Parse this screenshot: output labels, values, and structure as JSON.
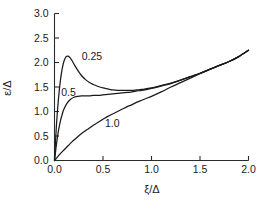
{
  "chart_data": {
    "type": "line",
    "title": "",
    "subtitle": "",
    "xlabel": "ξ/Δ",
    "ylabel": "ε/Δ",
    "xlim": [
      0.0,
      2.0
    ],
    "ylim": [
      0.0,
      3.0
    ],
    "xticks": [
      0.0,
      0.5,
      1.0,
      1.5,
      2.0
    ],
    "yticks": [
      0.0,
      0.5,
      1.0,
      1.5,
      2.0,
      2.5,
      3.0
    ],
    "xtick_labels": [
      "0.0",
      "0.5",
      "1.0",
      "1.5",
      "2.0"
    ],
    "ytick_labels": [
      "0.0",
      "0.5",
      "1.0",
      "1.5",
      "2.0",
      "2.5",
      "3.0"
    ],
    "grid": false,
    "legend_position": "inline-annotations",
    "annotations": [
      {
        "text": "0.25",
        "x": 0.28,
        "y": 2.12
      },
      {
        "text": "0.5",
        "x": 0.07,
        "y": 1.4
      },
      {
        "text": "1.0",
        "x": 0.52,
        "y": 0.77
      }
    ],
    "series": [
      {
        "name": "0.25",
        "label": "0.25",
        "color": "#1a1a1a",
        "x": [
          0.0,
          0.02,
          0.04,
          0.06,
          0.08,
          0.1,
          0.12,
          0.14,
          0.16,
          0.18,
          0.2,
          0.24,
          0.28,
          0.32,
          0.36,
          0.4,
          0.45,
          0.5,
          0.55,
          0.6,
          0.65,
          0.7,
          0.75,
          0.8,
          0.85,
          0.9,
          1.0,
          1.1,
          1.2,
          1.3,
          1.4,
          1.5,
          1.6,
          1.7,
          1.8,
          1.9,
          2.0
        ],
        "y": [
          0.0,
          0.72,
          1.24,
          1.62,
          1.88,
          2.04,
          2.12,
          2.13,
          2.1,
          2.04,
          1.97,
          1.84,
          1.73,
          1.65,
          1.59,
          1.55,
          1.51,
          1.48,
          1.46,
          1.44,
          1.43,
          1.43,
          1.43,
          1.43,
          1.44,
          1.45,
          1.48,
          1.53,
          1.58,
          1.64,
          1.71,
          1.78,
          1.86,
          1.94,
          2.02,
          2.12,
          2.25
        ]
      },
      {
        "name": "0.5",
        "label": "0.5",
        "color": "#1a1a1a",
        "x": [
          0.0,
          0.02,
          0.04,
          0.06,
          0.08,
          0.1,
          0.13,
          0.16,
          0.2,
          0.24,
          0.28,
          0.32,
          0.36,
          0.4,
          0.45,
          0.5,
          0.55,
          0.6,
          0.65,
          0.7,
          0.75,
          0.8,
          0.85,
          0.9,
          1.0,
          1.1,
          1.2,
          1.3,
          1.4,
          1.5,
          1.6,
          1.7,
          1.8,
          1.9,
          2.0
        ],
        "y": [
          0.0,
          0.33,
          0.6,
          0.8,
          0.95,
          1.06,
          1.17,
          1.24,
          1.29,
          1.31,
          1.32,
          1.32,
          1.32,
          1.33,
          1.33,
          1.34,
          1.35,
          1.36,
          1.37,
          1.38,
          1.39,
          1.4,
          1.42,
          1.43,
          1.47,
          1.52,
          1.57,
          1.64,
          1.71,
          1.78,
          1.86,
          1.94,
          2.02,
          2.12,
          2.25
        ]
      },
      {
        "name": "1.0",
        "label": "1.0",
        "color": "#1a1a1a",
        "x": [
          0.0,
          0.03,
          0.06,
          0.1,
          0.14,
          0.18,
          0.22,
          0.26,
          0.3,
          0.35,
          0.4,
          0.45,
          0.5,
          0.55,
          0.6,
          0.65,
          0.7,
          0.75,
          0.8,
          0.85,
          0.9,
          0.95,
          1.0,
          1.1,
          1.2,
          1.3,
          1.4,
          1.5,
          1.6,
          1.7,
          1.8,
          1.9,
          2.0
        ],
        "y": [
          0.0,
          0.07,
          0.14,
          0.22,
          0.3,
          0.38,
          0.45,
          0.52,
          0.58,
          0.65,
          0.72,
          0.78,
          0.84,
          0.9,
          0.95,
          1.0,
          1.05,
          1.1,
          1.14,
          1.19,
          1.23,
          1.27,
          1.31,
          1.4,
          1.5,
          1.59,
          1.68,
          1.77,
          1.86,
          1.94,
          2.02,
          2.12,
          2.25
        ]
      }
    ]
  }
}
